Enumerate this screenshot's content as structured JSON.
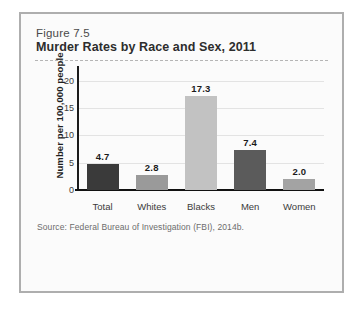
{
  "figure": {
    "number": "Figure 7.5",
    "title": "Murder Rates by Race and Sex, 2011",
    "source": "Source: Federal Bureau of Investigation (FBI), 2014b."
  },
  "chart_data": {
    "type": "bar",
    "title": "Murder Rates by Race and Sex, 2011",
    "xlabel": "",
    "ylabel": "Number per 100,000 people",
    "categories": [
      "Total",
      "Whites",
      "Blacks",
      "Men",
      "Women"
    ],
    "values": [
      4.7,
      2.8,
      17.3,
      7.4,
      2.0
    ],
    "value_labels": [
      "4.7",
      "2.8",
      "17.3",
      "7.4",
      "2.0"
    ],
    "bar_colors": [
      "#3a3a3a",
      "#9a9a9a",
      "#c2c2c2",
      "#5b5b5b",
      "#a3a3a3"
    ],
    "ylim": [
      0,
      22
    ],
    "yticks": [
      0,
      5,
      10,
      15,
      20
    ],
    "ytick_labels": [
      "0",
      "5",
      "10",
      "15",
      "20"
    ],
    "grid": true,
    "legend": "none"
  },
  "colors": {
    "card_border": "#aeaeae",
    "card_background": "#fbfbfb",
    "page_background": "#ffffff",
    "axis": "#111111",
    "gridline": "#e3e3e3",
    "dashed_rule": "#b5b5b5"
  }
}
